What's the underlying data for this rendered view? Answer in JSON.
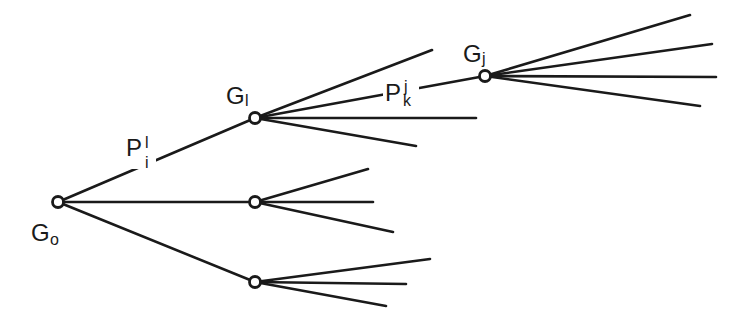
{
  "diagram": {
    "type": "tree",
    "nodes": [
      {
        "id": "G0",
        "label": "G",
        "subscript": "o",
        "x": 58,
        "y": 202
      },
      {
        "id": "Gl",
        "label": "G",
        "subscript": "l",
        "x": 255,
        "y": 118
      },
      {
        "id": "Gm",
        "label": "",
        "subscript": "",
        "x": 255,
        "y": 202
      },
      {
        "id": "Gb",
        "label": "",
        "subscript": "",
        "x": 255,
        "y": 282
      },
      {
        "id": "Gj",
        "label": "G",
        "subscript": "j",
        "x": 485,
        "y": 76
      }
    ],
    "edge_labels": [
      {
        "id": "Pil",
        "label": "P",
        "subscript": "i",
        "superscript": "l",
        "edge": "G0-Gl"
      },
      {
        "id": "Pkj",
        "label": "P",
        "subscript": "k",
        "superscript": "j",
        "edge": "Gl-Gj"
      }
    ],
    "colors": {
      "stroke": "#1a1a1a",
      "background": "#ffffff"
    }
  }
}
